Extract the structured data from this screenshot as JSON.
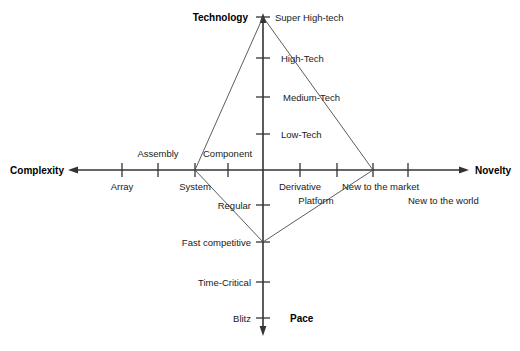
{
  "diagram": {
    "type": "four-axis-radar",
    "line_color": "#333333",
    "text_color": "#1a1a1a",
    "background": "#ffffff",
    "axes": [
      {
        "id": "technology",
        "name": "Technology",
        "direction": "up",
        "ticks": [
          {
            "label": "Super High-tech",
            "x": 275,
            "y": 17
          },
          {
            "label": "High-Tech",
            "x": 281,
            "y": 58
          },
          {
            "label": "Medium-Tech",
            "x": 283,
            "y": 97
          },
          {
            "label": "Low-Tech",
            "x": 281,
            "y": 134
          }
        ]
      },
      {
        "id": "complexity",
        "name": "Complexity",
        "direction": "left",
        "ticks": [
          {
            "label": "Array",
            "x": 122,
            "y": 186,
            "side": "below"
          },
          {
            "label": "Assembly",
            "x": 158,
            "y": 153,
            "side": "above"
          },
          {
            "label": "System",
            "x": 195,
            "y": 186,
            "side": "below"
          },
          {
            "label": "Component",
            "x": 206,
            "y": 153,
            "side": "above"
          }
        ]
      },
      {
        "id": "novelty",
        "name": "Novelty",
        "direction": "right",
        "ticks": [
          {
            "label": "Derivative",
            "x": 300,
            "y": 186
          },
          {
            "label": "Platform",
            "x": 316,
            "y": 200
          },
          {
            "label": "New to the market",
            "x": 345,
            "y": 186
          },
          {
            "label": "New to the world",
            "x": 408,
            "y": 200
          }
        ]
      },
      {
        "id": "pace",
        "name": "Pace",
        "direction": "down",
        "ticks": [
          {
            "label": "Regular",
            "x": 253,
            "y": 205
          },
          {
            "label": "Fast competitive",
            "x": 253,
            "y": 242
          },
          {
            "label": "Time-Critical",
            "x": 253,
            "y": 282
          },
          {
            "label": "Blitz",
            "x": 253,
            "y": 318
          }
        ]
      }
    ],
    "profile": {
      "name": "project-profile",
      "vertices": [
        {
          "axis": "technology",
          "level": "Super High-tech",
          "x": 263,
          "y": 17
        },
        {
          "axis": "novelty",
          "level": "New to the market",
          "x": 373,
          "y": 170
        },
        {
          "axis": "pace",
          "level": "Fast competitive",
          "x": 263,
          "y": 242
        },
        {
          "axis": "complexity",
          "level": "System",
          "x": 195,
          "y": 170
        }
      ]
    },
    "axis_labels": {
      "technology": "Technology",
      "complexity": "Complexity",
      "novelty": "Novelty",
      "pace": "Pace"
    }
  }
}
